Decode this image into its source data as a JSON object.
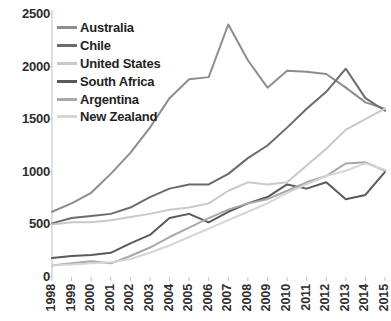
{
  "chart_data": {
    "type": "line",
    "title": "",
    "xlabel": "",
    "ylabel": "",
    "x": [
      1998,
      1999,
      2000,
      2001,
      2002,
      2003,
      2004,
      2005,
      2006,
      2007,
      2008,
      2009,
      2010,
      2011,
      2012,
      2013,
      2014,
      2015
    ],
    "categories": [
      "1998",
      "1999",
      "2000",
      "2001",
      "2002",
      "2003",
      "2004",
      "2005",
      "2006",
      "2007",
      "2008",
      "2009",
      "2010",
      "2011",
      "2012",
      "2013",
      "2014",
      "2015"
    ],
    "ylim": [
      0,
      2500
    ],
    "yticks": [
      0,
      500,
      1000,
      1500,
      2000,
      2500
    ],
    "ytick_labels": [
      "0",
      "500",
      "1000",
      "1500",
      "2000",
      "2500"
    ],
    "grid": false,
    "legend_position": "top-left inside plot",
    "series": [
      {
        "name": "Australia",
        "color": "#8d8d8d",
        "values": [
          620,
          700,
          800,
          980,
          1180,
          1420,
          1700,
          1880,
          1900,
          2400,
          2060,
          1800,
          1960,
          1950,
          1930,
          1800,
          1660,
          1600
        ]
      },
      {
        "name": "Chile",
        "color": "#6b6b6b",
        "values": [
          510,
          560,
          580,
          600,
          660,
          760,
          840,
          880,
          880,
          980,
          1130,
          1250,
          1420,
          1600,
          1760,
          1980,
          1700,
          1580
        ]
      },
      {
        "name": "United States",
        "color": "#c9c9c9",
        "values": [
          500,
          520,
          520,
          540,
          570,
          600,
          640,
          660,
          700,
          820,
          900,
          880,
          900,
          1060,
          1220,
          1400,
          1500,
          1600
        ]
      },
      {
        "name": "South Africa",
        "color": "#5a5a5a",
        "values": [
          180,
          200,
          210,
          230,
          320,
          400,
          560,
          600,
          520,
          620,
          700,
          760,
          880,
          840,
          900,
          740,
          780,
          1000
        ]
      },
      {
        "name": "Argentina",
        "color": "#a8a8a8",
        "values": [
          110,
          130,
          150,
          130,
          200,
          280,
          380,
          470,
          560,
          640,
          700,
          740,
          820,
          900,
          960,
          1080,
          1090,
          1010
        ]
      },
      {
        "name": "New Zealand",
        "color": "#d5d5d5",
        "values": [
          110,
          120,
          130,
          140,
          170,
          230,
          300,
          380,
          460,
          540,
          620,
          700,
          800,
          880,
          960,
          1010,
          1080,
          1020
        ]
      }
    ]
  },
  "legend": {
    "items": [
      {
        "label": "Australia"
      },
      {
        "label": "Chile"
      },
      {
        "label": "United States"
      },
      {
        "label": "South Africa"
      },
      {
        "label": "Argentina"
      },
      {
        "label": "New Zealand"
      }
    ]
  },
  "axis": {
    "y_axis_color": "#bfbfbf",
    "tick_color": "#bfbfbf"
  }
}
